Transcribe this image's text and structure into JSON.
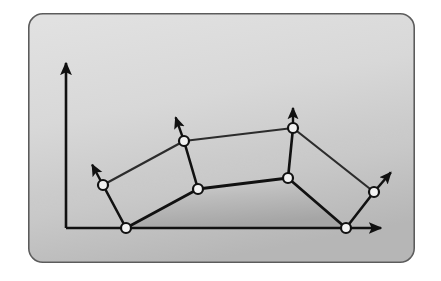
{
  "figure": {
    "title": "",
    "caption": "",
    "panel": {
      "name": "rounded-panel",
      "x": 28,
      "y": 13,
      "width": 387,
      "height": 250,
      "corner_radius": 14,
      "fill_top": "#dcdcdc",
      "fill_bottom": "#b9b9b9",
      "border_color": "#5a5a5a",
      "border_width": 1.6
    },
    "axes": {
      "name": "axes",
      "stroke": "#111111",
      "stroke_width": 2.6,
      "origin": {
        "x": 66,
        "y": 228
      },
      "x_axis": {
        "x1": 66,
        "y1": 228,
        "x2": 392,
        "y2": 228,
        "arrow_tip_x": 392,
        "arrow_tip_y": 228
      },
      "y_axis": {
        "x1": 66,
        "y1": 228,
        "x2": 66,
        "y2": 52,
        "arrow_tip_x": 66,
        "arrow_tip_y": 52
      }
    },
    "shaded_region": {
      "name": "shaded-region",
      "fill_light": "#d2d2d2",
      "fill_dark": "#a9a9a9",
      "points": "126,228 198,189 288,178 346,228"
    },
    "nodes_upper": [
      {
        "label": "u1",
        "x": 103,
        "y": 185
      },
      {
        "label": "u2",
        "x": 184,
        "y": 141
      },
      {
        "label": "u3",
        "x": 293,
        "y": 128
      },
      {
        "label": "u4",
        "x": 374,
        "y": 192
      }
    ],
    "nodes_lower": [
      {
        "label": "l1",
        "x": 126,
        "y": 228
      },
      {
        "label": "l2",
        "x": 198,
        "y": 189
      },
      {
        "label": "l3",
        "x": 288,
        "y": 178
      },
      {
        "label": "l4",
        "x": 346,
        "y": 228
      }
    ],
    "node_style": {
      "radius": 5,
      "fill": "#f2f2f2",
      "stroke": "#111111",
      "stroke_width": 2.2
    },
    "upper_chain": {
      "name": "upper-chain",
      "points": "103,185 184,141 293,128 374,192",
      "stroke": "#2c2c2c",
      "stroke_width": 2.2
    },
    "lower_chain": {
      "name": "lower-chain",
      "points": "126,228 198,189 288,178 346,228",
      "stroke": "#111111",
      "stroke_width": 2.8
    },
    "struts": [
      {
        "label": "s1",
        "x1": 103,
        "y1": 185,
        "x2": 126,
        "y2": 228
      },
      {
        "label": "s2",
        "x1": 184,
        "y1": 141,
        "x2": 198,
        "y2": 189
      },
      {
        "label": "s3",
        "x1": 293,
        "y1": 128,
        "x2": 288,
        "y2": 178
      },
      {
        "label": "s4",
        "x1": 374,
        "y1": 192,
        "x2": 346,
        "y2": 228
      }
    ],
    "strut_style": {
      "stroke": "#111111",
      "stroke_width": 2.6
    },
    "vectors": [
      {
        "label": "v1",
        "from_x": 103,
        "from_y": 185,
        "to_x": 87,
        "to_y": 155
      },
      {
        "label": "v2",
        "from_x": 184,
        "from_y": 141,
        "to_x": 172,
        "to_y": 107
      },
      {
        "label": "v3",
        "from_x": 293,
        "from_y": 128,
        "to_x": 293,
        "to_y": 97
      },
      {
        "label": "v4",
        "from_x": 374,
        "from_y": 192,
        "to_x": 398,
        "to_y": 164
      }
    ],
    "vector_style": {
      "stroke": "#111111",
      "stroke_width": 2.4,
      "arrow_length": 11,
      "arrow_width": 6
    }
  }
}
